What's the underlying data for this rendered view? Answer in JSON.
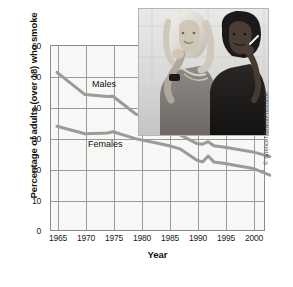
{
  "chart_data": {
    "type": "line",
    "title": "",
    "xlabel": "Year",
    "ylabel": "Percentage of adults (over 18) who smoke",
    "xlim": [
      1965,
      2003
    ],
    "ylim": [
      0,
      60
    ],
    "xticks": [
      "1965",
      "1970",
      "1975",
      "1980",
      "1985",
      "1990",
      "1995",
      "2000"
    ],
    "xtick_values": [
      1965,
      1970,
      1975,
      1980,
      1985,
      1990,
      1995,
      2000
    ],
    "yticks": [
      "0",
      "10",
      "20",
      "30",
      "40",
      "50",
      "60"
    ],
    "ytick_values": [
      0,
      10,
      20,
      30,
      40,
      50,
      60
    ],
    "grid": true,
    "legend_position": "inline-labels",
    "series": [
      {
        "name": "Males",
        "x": [
          1965,
          1970,
          1974,
          1975,
          1979,
          1980,
          1983,
          1985,
          1987,
          1990,
          1991,
          1992,
          1993,
          1995,
          2000,
          2003
        ],
        "values": [
          51.2,
          44.0,
          43.4,
          43.5,
          37.8,
          37.2,
          35.0,
          32.5,
          31.0,
          28.2,
          28.0,
          28.8,
          27.5,
          27.0,
          25.5,
          24.0
        ]
      },
      {
        "name": "Females",
        "x": [
          1965,
          1970,
          1974,
          1975,
          1979,
          1980,
          1983,
          1985,
          1987,
          1990,
          1991,
          1992,
          1993,
          1995,
          2000,
          2003
        ],
        "values": [
          33.8,
          31.4,
          31.6,
          32.0,
          29.8,
          29.4,
          28.3,
          27.5,
          26.5,
          22.8,
          22.3,
          24.2,
          22.3,
          21.8,
          20.2,
          18.0
        ]
      }
    ]
  },
  "axis": {
    "ylabel": "Percentage of adults (over 18) who smoke",
    "xlabel": "Year"
  },
  "series_labels": {
    "males": "Males",
    "females": "Females"
  },
  "photo": {
    "caption": "two-women-smoking-photo"
  },
  "credit": {
    "text": "© Spencer Grant/PhotoEdit"
  },
  "colors": {
    "line": "#9a9a9a",
    "line_dark": "#6f6f6f",
    "grid": "#9a9a98",
    "frame": "#8a8a8a",
    "plot_background": "#f7f7f5",
    "text": "#111111"
  }
}
